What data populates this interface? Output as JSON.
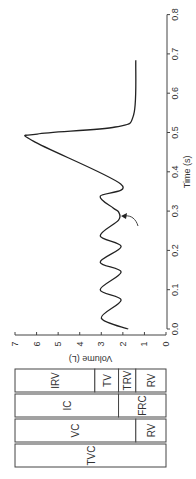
{
  "chart_data": {
    "type": "line",
    "title": "",
    "xlabel": "Time (s)",
    "ylabel": "Volume (L)",
    "xlim": [
      0.0,
      0.8
    ],
    "ylim": [
      0,
      7
    ],
    "orientation": "rotated 90 degrees counter-clockwise",
    "x_ticks": [
      "0.0",
      "0.1",
      "0.2",
      "0.3",
      "0.4",
      "0.5",
      "0.6",
      "0.7",
      "0.8"
    ],
    "y_ticks": [
      "0",
      "1",
      "2",
      "3",
      "4",
      "5",
      "6",
      "7"
    ],
    "grid": false,
    "series": [
      {
        "name": "Lung volume",
        "points": [
          [
            0.0,
            1.75
          ],
          [
            0.028,
            3.0
          ],
          [
            0.074,
            2.08
          ],
          [
            0.1,
            3.05
          ],
          [
            0.145,
            2.08
          ],
          [
            0.17,
            3.05
          ],
          [
            0.21,
            2.08
          ],
          [
            0.237,
            3.05
          ],
          [
            0.277,
            2.2
          ],
          [
            0.298,
            2.2
          ],
          [
            0.308,
            2.45
          ],
          [
            0.338,
            3.05
          ],
          [
            0.369,
            2.1
          ],
          [
            0.478,
            6.15
          ],
          [
            0.496,
            5.97
          ],
          [
            0.514,
            2.35
          ],
          [
            0.545,
            1.5
          ],
          [
            0.684,
            1.4
          ]
        ]
      }
    ],
    "annotations": [
      {
        "type": "arrow",
        "points_to": [
          0.29,
          2.2
        ],
        "description": "pause at end of normal expiration"
      }
    ]
  },
  "volume_bars": {
    "rows": [
      {
        "segments": [
          {
            "label": "IRV",
            "from": 7.0,
            "to": 3.3
          },
          {
            "label": "TV",
            "from": 3.3,
            "to": 2.2
          },
          {
            "label": "TRV",
            "from": 2.2,
            "to": 1.4
          },
          {
            "label": "RV",
            "from": 1.4,
            "to": 0
          }
        ]
      },
      {
        "segments": [
          {
            "label": "IC",
            "from": 7.0,
            "to": 2.2
          },
          {
            "label": "FRC",
            "from": 2.2,
            "to": 0
          }
        ]
      },
      {
        "segments": [
          {
            "label": "VC",
            "from": 7.0,
            "to": 1.4
          },
          {
            "label": "RV",
            "from": 1.4,
            "to": 0
          }
        ]
      },
      {
        "segments": [
          {
            "label": "TVC",
            "from": 7.0,
            "to": 0
          }
        ]
      }
    ]
  }
}
